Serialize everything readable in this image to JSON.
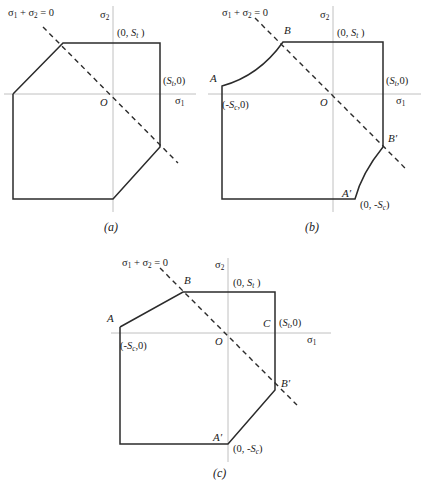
{
  "figure": {
    "subfigures": [
      {
        "id": "a",
        "caption": "(a)",
        "axis_x_label": "σ",
        "axis_x_sub": "1",
        "axis_y_label": "σ",
        "axis_y_sub": "2",
        "origin_label": "O",
        "dashed_line_label": "σ₁ + σ₂ = 0",
        "labels": {
          "tensile_y": "(0, S",
          "tensile_y_sub": "t",
          "tensile_y_end": " )",
          "tensile_x": "(S",
          "tensile_x_sub": "t",
          "tensile_x_end": ",0)"
        },
        "points": []
      },
      {
        "id": "b",
        "caption": "(b)",
        "axis_x_label": "σ",
        "axis_x_sub": "1",
        "axis_y_label": "σ",
        "axis_y_sub": "2",
        "origin_label": "O",
        "dashed_line_label": "σ₁ + σ₂ = 0",
        "labels": {
          "tensile_y": "(0, S",
          "tensile_y_sub": "t",
          "tensile_y_end": " )",
          "tensile_x": "(S",
          "tensile_x_sub": "t",
          "tensile_x_end": ",0)",
          "compressive_x": "(-S",
          "compressive_x_sub": "c",
          "compressive_x_end": ",0)",
          "compressive_y": "(0, -S",
          "compressive_y_sub": "c",
          "compressive_y_end": ")"
        },
        "points": [
          "A",
          "B",
          "A′",
          "B′"
        ]
      },
      {
        "id": "c",
        "caption": "(c)",
        "axis_x_label": "σ",
        "axis_x_sub": "1",
        "axis_y_label": "σ",
        "axis_y_sub": "2",
        "origin_label": "O",
        "dashed_line_label": "σ₁ + σ₂ = 0",
        "labels": {
          "tensile_y": "(0, S",
          "tensile_y_sub": "t",
          "tensile_y_end": " )",
          "tensile_x": "(S",
          "tensile_x_sub": "t",
          "tensile_x_end": ",0)",
          "compressive_x": "(-S",
          "compressive_x_sub": "c",
          "compressive_x_end": ",0)",
          "compressive_y": "(0, -S",
          "compressive_y_sub": "c",
          "compressive_y_end": ")"
        },
        "points": [
          "A",
          "B",
          "C",
          "A′",
          "B′"
        ]
      }
    ],
    "point_labels": {
      "A": "A",
      "B": "B",
      "C": "C",
      "A_prime": "A′",
      "B_prime": "B′"
    },
    "colors": {
      "envelope": "#2b2b2b",
      "axis": "#b9b9b9",
      "dashed": "#2b2b2b",
      "background": "#ffffff"
    }
  }
}
